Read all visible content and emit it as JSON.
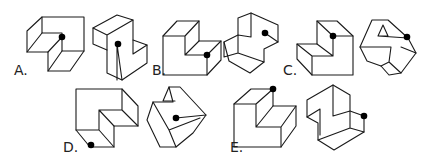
{
  "puzzle": {
    "description": "Spatial reasoning: which pair of figures shows the same solid with the dot at the same vertex",
    "options": [
      {
        "label": "A.",
        "figures": [
          "A-left",
          "A-right"
        ]
      },
      {
        "label": "B.",
        "figures": [
          "B-left",
          "B-right"
        ]
      },
      {
        "label": "C.",
        "figures": [
          "C-left",
          "C-right"
        ]
      },
      {
        "label": "D.",
        "figures": [
          "D-left",
          "D-right"
        ]
      },
      {
        "label": "E.",
        "figures": [
          "E-left",
          "E-right"
        ]
      }
    ]
  },
  "colors": {
    "stroke": "#1a1a1a",
    "dot": "#000000",
    "background": "#ffffff"
  }
}
